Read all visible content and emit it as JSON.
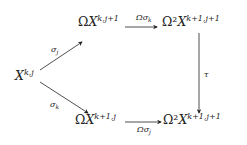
{
  "diagram": {
    "type": "commutative-diagram",
    "nodes": {
      "source": {
        "base": "X",
        "sup": "k,j"
      },
      "top_mid": {
        "prefix": "Ω",
        "base": "X",
        "sup": "k,j+1"
      },
      "top_right": {
        "prefix": "Ω²",
        "base": "X",
        "sup": "k+1,j+1"
      },
      "bottom_mid": {
        "prefix": "Ω",
        "base": "X",
        "sup": "k+1,j"
      },
      "bottom_right": {
        "prefix": "Ω²",
        "base": "X",
        "sup": "k+1,j+1"
      }
    },
    "arrows": {
      "sigma_j": {
        "sym": "σ",
        "sub": "j"
      },
      "sigma_k": {
        "sym": "σ",
        "sub": "k"
      },
      "omega_sigma_k": {
        "sym": "Ωσ",
        "sub": "k"
      },
      "tau": {
        "sym": "τ",
        "sub": ""
      },
      "omega_sigma_j": {
        "sym": "Ωσ",
        "sub": "j"
      }
    },
    "color": "#222222"
  }
}
